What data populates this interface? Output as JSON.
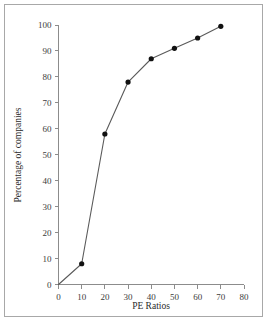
{
  "chart_data": {
    "type": "line",
    "title": "",
    "subtitle": "",
    "xlabel": "PE Ratios",
    "ylabel": "Percentage of companies",
    "xlim": [
      0,
      80
    ],
    "ylim": [
      0,
      100
    ],
    "xticks": [
      0,
      10,
      20,
      30,
      40,
      50,
      60,
      70,
      80
    ],
    "yticks": [
      0,
      10,
      20,
      30,
      40,
      50,
      60,
      70,
      80,
      90,
      100
    ],
    "xtick_labels": [
      "0",
      "10",
      "20",
      "30",
      "40",
      "50",
      "60",
      "70",
      "80"
    ],
    "ytick_labels": [
      "0",
      "10",
      "20",
      "30",
      "40",
      "50",
      "60",
      "70",
      "80",
      "90",
      "100"
    ],
    "grid": false,
    "legend": false,
    "legend_position": "none",
    "marker": "filled-circle",
    "line_color": "#5a5a5a",
    "marker_color": "#111111",
    "axis_color": "#8c8c8c",
    "background_color": "#ffffff",
    "border_color": "#a8a8a8",
    "x": [
      0,
      10,
      20,
      30,
      40,
      50,
      60,
      70
    ],
    "series": [
      {
        "name": "Cumulative percentage of companies",
        "values": [
          0,
          8,
          58,
          78,
          87,
          91,
          95,
          99.5
        ]
      }
    ],
    "points": [
      {
        "x": 0,
        "y": 0
      },
      {
        "x": 10,
        "y": 8
      },
      {
        "x": 20,
        "y": 58
      },
      {
        "x": 30,
        "y": 78
      },
      {
        "x": 40,
        "y": 87
      },
      {
        "x": 50,
        "y": 91
      },
      {
        "x": 60,
        "y": 95
      },
      {
        "x": 70,
        "y": 99.5
      }
    ],
    "annotations": []
  }
}
